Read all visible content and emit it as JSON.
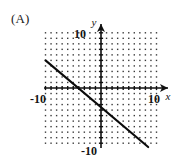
{
  "figure": {
    "panel_label": "(A)",
    "background_color": "#ffffff",
    "ink_color": "#111111"
  },
  "axes": {
    "x_axis_name": "x",
    "y_axis_name": "y",
    "x_tick_labels": [
      "-10",
      "10"
    ],
    "y_tick_labels": [
      "10",
      "-10"
    ],
    "x_left_label": "-10",
    "x_right_label": "10",
    "y_top_label": "10",
    "y_bottom_label": "-10"
  },
  "chart_data": {
    "type": "line",
    "title": "",
    "subtitle": "",
    "xlabel": "x",
    "ylabel": "y",
    "xlim": [
      -10,
      10
    ],
    "ylim": [
      -10,
      10
    ],
    "xticks": [
      -10,
      10
    ],
    "yticks": [
      -10,
      10
    ],
    "grid": true,
    "grid_style": "dotted-lattice",
    "grid_spacing": 1,
    "legend": null,
    "series": [
      {
        "name": "line",
        "type": "line",
        "slope": -0.85,
        "intercept": -3.5,
        "equation": "y = -0.85x - 3.5",
        "x_intercept": -4.1,
        "y_intercept": -3.5,
        "x": [
          -10,
          8.5
        ],
        "y": [
          5.0,
          -10.7
        ],
        "endpoints": [
          [
            -10,
            5.0
          ],
          [
            8.5,
            -10.7
          ]
        ]
      }
    ],
    "annotations": [
      {
        "text": "(A)",
        "position": "top-left-outside"
      }
    ]
  }
}
